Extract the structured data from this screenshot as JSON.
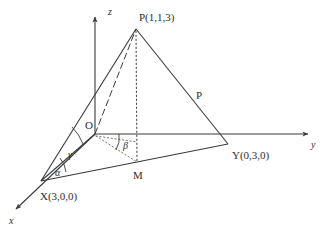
{
  "figure": {
    "background": "#ffffff",
    "line_color": "#3a3a3a",
    "text_color": "#2e2e2e"
  },
  "axes": [
    {
      "name": "x-axis",
      "label": "x",
      "direction": "down-left",
      "arrow": true
    },
    {
      "name": "y-axis",
      "label": "y",
      "direction": "right",
      "arrow": true
    },
    {
      "name": "z-axis",
      "label": "z",
      "direction": "up",
      "arrow": true
    }
  ],
  "points": [
    {
      "name": "origin",
      "label": "O",
      "coords": null
    },
    {
      "name": "vertex-x",
      "label": "X(3,0,0)",
      "coords": [
        3,
        0,
        0
      ]
    },
    {
      "name": "vertex-y",
      "label": "Y(0,3,0)",
      "coords": [
        0,
        3,
        0
      ]
    },
    {
      "name": "apex-p",
      "label": "P(1,1,3)",
      "coords": [
        1,
        1,
        3
      ]
    },
    {
      "name": "foot-m",
      "label": "M",
      "coords": null
    }
  ],
  "angles": [
    {
      "name": "angle-alpha",
      "label": "α",
      "vertex": "X"
    },
    {
      "name": "angle-beta",
      "label": "β",
      "vertex": "O"
    },
    {
      "name": "angle-gamma",
      "label": "γ",
      "vertex": "X"
    }
  ],
  "plane": {
    "name": "plane-p",
    "label": "P"
  }
}
